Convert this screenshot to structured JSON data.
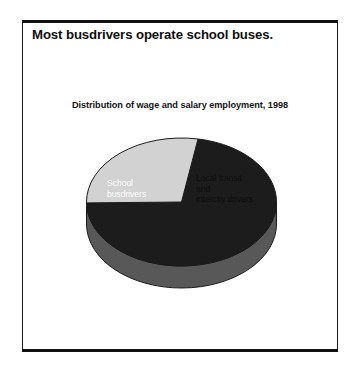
{
  "figure": {
    "headline": "Most busdrivers operate school buses."
  },
  "chart_data": {
    "type": "pie",
    "title": "Distribution of wage and salary employment, 1998",
    "subtitle": "",
    "xlabel": "",
    "ylabel": "",
    "grid": false,
    "legend": "none (slices labeled in place)",
    "three_d": true,
    "categories": [
      "School busdrivers",
      "Local transit and intercity drivers"
    ],
    "values": [
      72,
      28
    ],
    "value_unit": "percent of wage and salary employment",
    "slices": [
      {
        "label": "School\nbusdrivers",
        "label_plain": "School busdrivers",
        "value": 72,
        "color": "#1c1c1c",
        "side_color": "#585858",
        "label_color": "#ffffff"
      },
      {
        "label": "Local transit\nand\nintercity drivers",
        "label_plain": "Local transit and intercity drivers",
        "value": 28,
        "color": "#d2d2d2",
        "side_color": "#8c8c8c",
        "label_color": "#0d0d0d"
      }
    ]
  },
  "colors": {
    "frame": "#1a1a1a",
    "rule": "#111111",
    "background": "#ffffff",
    "dark_slice": "#1c1c1c",
    "light_slice": "#d2d2d2",
    "dark_side": "#585858",
    "light_side": "#8c8c8c",
    "outline": "#1a1a1a"
  }
}
